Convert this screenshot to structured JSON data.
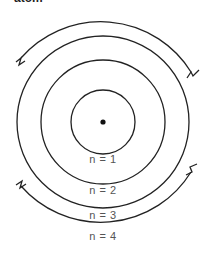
{
  "caption": "atom",
  "diagram": {
    "center": {
      "x": 103,
      "y": 122
    },
    "stroke_color": "#222222",
    "shells": [
      {
        "label": "n = 1",
        "radius": 32,
        "complete": true
      },
      {
        "label": "n = 2",
        "radius": 62,
        "complete": true
      },
      {
        "label": "n = 3",
        "radius": 86,
        "complete": true
      },
      {
        "label": "n = 4",
        "radius": 106,
        "complete": false
      }
    ],
    "nucleus": "dot"
  },
  "labels": {
    "n1": "n = 1",
    "n2": "n = 2",
    "n3": "n = 3",
    "n4": "n = 4"
  }
}
